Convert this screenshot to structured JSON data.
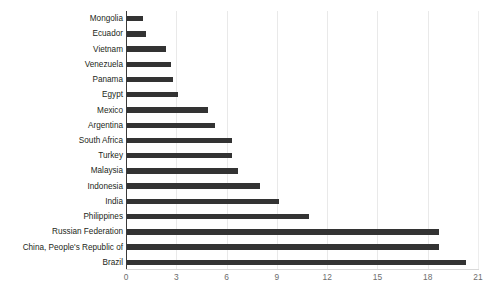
{
  "chart_data": {
    "type": "bar",
    "orientation": "horizontal",
    "title": "",
    "subtitle": "",
    "xlabel": "",
    "ylabel": "",
    "xlim": [
      0,
      21
    ],
    "ylim": null,
    "grid": true,
    "grid_axis": "x",
    "legend": false,
    "legend_position": "none",
    "bar_color": "#333333",
    "grid_color": "#e9e9e9",
    "axis_color": "#3a3a3a",
    "label_color": "#231f20",
    "tick_label_color": "#6d6d6d",
    "xticks": [
      0,
      3,
      6,
      9,
      12,
      15,
      18,
      21
    ],
    "xtick_labels": [
      "0",
      "3",
      "6",
      "9",
      "12",
      "15",
      "18",
      "21"
    ],
    "categories": [
      "Mongolia",
      "Ecuador",
      "Vietnam",
      "Venezuela",
      "Panama",
      "Egypt",
      "Mexico",
      "Argentina",
      "South Africa",
      "Turkey",
      "Malaysia",
      "Indonesia",
      "India",
      "Philippines",
      "Russian Federation",
      "China, People's Republic of",
      "Brazil"
    ],
    "values": [
      1.0,
      1.2,
      2.4,
      2.7,
      2.8,
      3.1,
      4.9,
      5.3,
      6.3,
      6.3,
      6.7,
      8.0,
      9.1,
      10.9,
      18.7,
      18.7,
      20.3
    ]
  }
}
